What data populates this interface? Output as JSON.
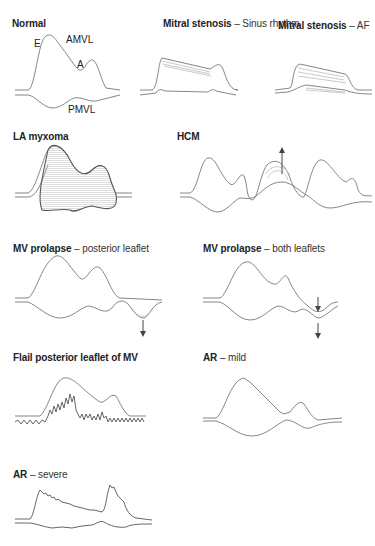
{
  "figure": {
    "panels": [
      {
        "id": "normal",
        "title_bold": "Normal",
        "title_rest": "",
        "labels": [
          "E",
          "AMVL",
          "A",
          "PMVL"
        ]
      },
      {
        "id": "ms-sinus",
        "title_bold": "Mitral stenosis",
        "title_rest": "– Sinus rhythm"
      },
      {
        "id": "ms-af",
        "title_bold": "Mitral stenosis",
        "title_rest": "– AF"
      },
      {
        "id": "la-myxoma",
        "title_bold": "LA myxoma",
        "title_rest": ""
      },
      {
        "id": "hcm",
        "title_bold": "HCM",
        "title_rest": ""
      },
      {
        "id": "mvp-posterior",
        "title_bold": "MV prolapse",
        "title_rest": "– posterior leaflet"
      },
      {
        "id": "mvp-both",
        "title_bold": "MV prolapse",
        "title_rest": "– both leaflets"
      },
      {
        "id": "flail",
        "title_bold": "Flail posterior leaflet of MV",
        "title_rest": ""
      },
      {
        "id": "ar-mild",
        "title_bold": "AR",
        "title_rest": "– mild"
      },
      {
        "id": "ar-severe",
        "title_bold": "AR",
        "title_rest": "– severe"
      }
    ],
    "labels": {
      "E": "E",
      "AMVL": "AMVL",
      "A": "A",
      "PMVL": "PMVL"
    }
  }
}
